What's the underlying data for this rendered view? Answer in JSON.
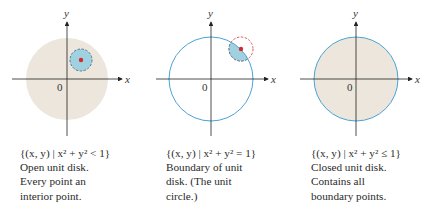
{
  "colors": {
    "disk_fill": "#ece6dc",
    "boundary_blue": "#4aa3d6",
    "neighborhood_fill": "#9fd1e0",
    "neighborhood_dash_blue": "#5a7d92",
    "neighborhood_dash_red": "#e05a5a",
    "point_red": "#d42a2a",
    "axis": "#222222"
  },
  "panels": [
    {
      "axis_x_label": "x",
      "axis_y_label": "y",
      "origin_label": "0",
      "set_notation": "{(x, y) | x² + y² < 1}",
      "description_lines": [
        "Open unit disk.",
        "Every point an",
        "interior point."
      ]
    },
    {
      "axis_x_label": "x",
      "axis_y_label": "y",
      "origin_label": "0",
      "set_notation": "{(x, y) | x² + y² = 1}",
      "description_lines": [
        "Boundary of unit",
        "disk. (The unit",
        "circle.)"
      ]
    },
    {
      "axis_x_label": "x",
      "axis_y_label": "y",
      "origin_label": "0",
      "set_notation": "{(x, y) | x² + y² ≤ 1}",
      "description_lines": [
        "Closed unit disk.",
        "Contains all",
        "boundary points."
      ]
    }
  ]
}
